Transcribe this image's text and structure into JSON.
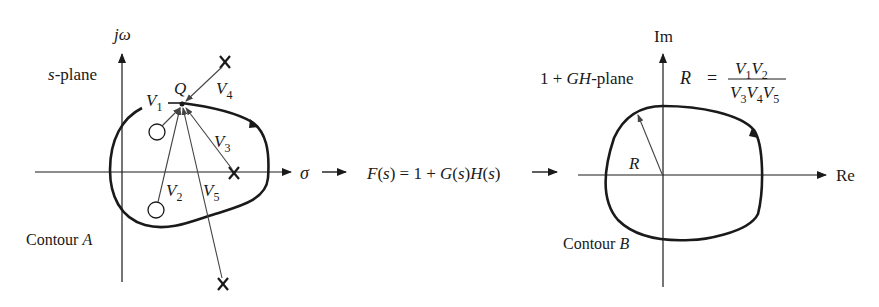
{
  "s_plane": {
    "vertical_axis_label": "jω",
    "horizontal_axis_label": "σ",
    "plane_label": "s-plane",
    "point_label": "Q",
    "contour_label_prefix": "Contour ",
    "contour_label_letter": "A",
    "vectors": [
      "V",
      "V",
      "V",
      "V",
      "V"
    ],
    "vector_subscripts": [
      "1",
      "2",
      "3",
      "4",
      "5"
    ],
    "zeros_count": 2,
    "poles_count": 3
  },
  "mapping": {
    "function_text": "F(s) = 1 + G(s)H(s)"
  },
  "gh_plane": {
    "vertical_axis_label": "Im",
    "horizontal_axis_label": "Re",
    "plane_label": "1 + GH-plane",
    "radius_label": "R",
    "contour_label_prefix": "Contour ",
    "contour_label_letter": "B",
    "formula": {
      "lhs": "R",
      "eq": "=",
      "numerator": "V1V2",
      "denominator": "V3V4V5"
    }
  }
}
